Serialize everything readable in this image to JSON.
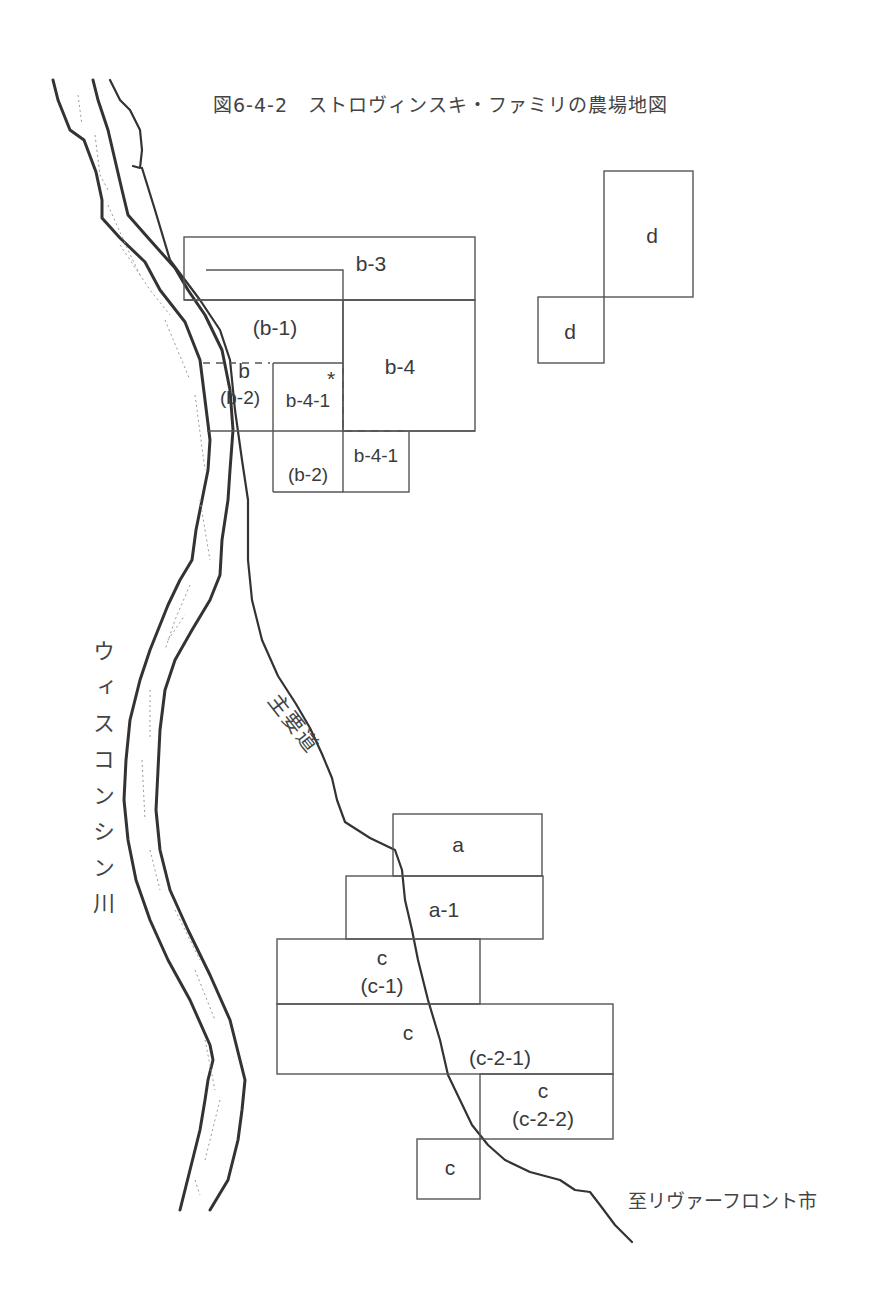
{
  "figure": {
    "title": "図6-4-2　ストロヴィンスキ・ファミリの農場地図"
  },
  "labels": {
    "river": "ウィスコンシン川",
    "road": "主要道",
    "destination": "至リヴァーフロント市"
  },
  "plots": {
    "b3": "b-3",
    "b1": "(b-1)",
    "b": "b",
    "b2_upper": "(b-2)",
    "b41_upper": "b-4-1",
    "asterisk": "*",
    "b4": "b-4",
    "b2_lower": "(b-2)",
    "b41_lower": "b-4-1",
    "d_large": "d",
    "d_small": "d",
    "a": "a",
    "a1": "a-1",
    "c_top": "c",
    "c1": "(c-1)",
    "c_mid": "c",
    "c21": "(c-2-1)",
    "c_right": "c",
    "c22": "(c-2-2)",
    "c_bottom": "c"
  },
  "colors": {
    "line": "#555555",
    "river": "#333333",
    "text": "#3a3a3a",
    "background": "#ffffff"
  }
}
